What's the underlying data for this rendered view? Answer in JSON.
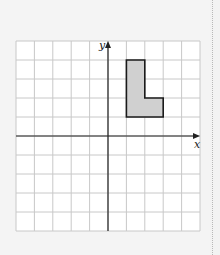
{
  "diagram": {
    "type": "coordinate-grid",
    "x_axis_label": "x",
    "y_axis_label": "y",
    "grid": {
      "cols": 10,
      "rows": 10,
      "x_range": [
        -5,
        5
      ],
      "y_range": [
        -5,
        5
      ]
    },
    "shape": {
      "name": "L-shape",
      "fill": "#d0d0d0",
      "stroke": "#1a1a1a",
      "vertices": [
        [
          1,
          4
        ],
        [
          2,
          4
        ],
        [
          2,
          2
        ],
        [
          3,
          2
        ],
        [
          3,
          1
        ],
        [
          1,
          1
        ]
      ]
    },
    "colors": {
      "grid": "#c8c8c8",
      "axis": "#222222",
      "background": "#ffffff"
    }
  }
}
